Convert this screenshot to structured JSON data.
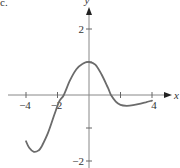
{
  "figure_label": "c.",
  "chart_data": {
    "type": "line",
    "title": "",
    "xlabel": "x",
    "ylabel": "y",
    "xlim": [
      -4.2,
      4.8
    ],
    "ylim": [
      -2.2,
      2.8
    ],
    "x_ticks": [
      -4,
      -2,
      2,
      4
    ],
    "x_tick_labels": [
      "−4",
      "−2",
      "",
      "4"
    ],
    "y_ticks": [
      -2,
      -1,
      1,
      2
    ],
    "y_tick_labels": [
      "−2",
      "",
      "",
      "2"
    ],
    "grid": false,
    "legend": null,
    "series": [
      {
        "name": "f(x)",
        "color": "#6b6b6b",
        "points": [
          [
            -4.0,
            -1.4
          ],
          [
            -3.8,
            -1.6
          ],
          [
            -3.5,
            -1.72
          ],
          [
            -3.2,
            -1.68
          ],
          [
            -3.0,
            -1.55
          ],
          [
            -2.6,
            -1.15
          ],
          [
            -2.2,
            -0.6
          ],
          [
            -1.9,
            -0.2
          ],
          [
            -1.6,
            0.0
          ],
          [
            -1.2,
            0.45
          ],
          [
            -0.8,
            0.78
          ],
          [
            -0.4,
            0.95
          ],
          [
            0.0,
            1.0
          ],
          [
            0.4,
            0.92
          ],
          [
            0.8,
            0.62
          ],
          [
            1.2,
            0.22
          ],
          [
            1.4,
            0.0
          ],
          [
            1.7,
            -0.2
          ],
          [
            2.0,
            -0.3
          ],
          [
            2.4,
            -0.33
          ],
          [
            2.8,
            -0.31
          ],
          [
            3.2,
            -0.27
          ],
          [
            3.6,
            -0.22
          ],
          [
            4.0,
            -0.17
          ]
        ]
      }
    ]
  },
  "axes": {
    "x_axis_label": "x",
    "y_axis_label": "y"
  }
}
